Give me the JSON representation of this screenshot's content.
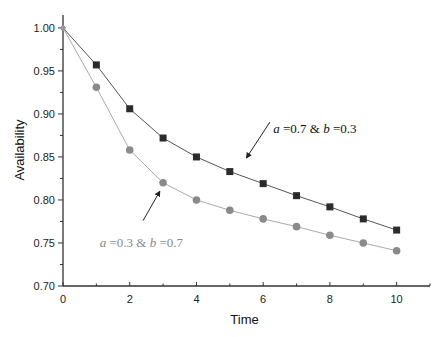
{
  "chart_data": {
    "type": "line",
    "title": "",
    "xlabel": "Time",
    "ylabel": "Availability",
    "xlim": [
      0,
      11
    ],
    "ylim": [
      0.7,
      1.015
    ],
    "x_ticks": [
      0,
      2,
      4,
      6,
      8,
      10
    ],
    "x_tick_labels": [
      "0",
      "2",
      "4",
      "6",
      "8",
      "10"
    ],
    "y_ticks": [
      0.7,
      0.75,
      0.8,
      0.85,
      0.9,
      0.95,
      1.0
    ],
    "y_tick_labels": [
      "0.70",
      "0.75",
      "0.80",
      "0.85",
      "0.90",
      "0.95",
      "1.00"
    ],
    "grid": false,
    "x": [
      0,
      1,
      2,
      3,
      4,
      5,
      6,
      7,
      8,
      9,
      10
    ],
    "series": [
      {
        "name": "a =0.7 & b =0.3",
        "marker": "square",
        "color": "#2b2b2b",
        "line_color": "#555555",
        "values": [
          1.0,
          0.957,
          0.906,
          0.872,
          0.85,
          0.833,
          0.819,
          0.805,
          0.792,
          0.778,
          0.765
        ]
      },
      {
        "name": "a =0.3 & b =0.7",
        "marker": "circle",
        "color": "#8a8a8a",
        "line_color": "#aaaaaa",
        "values": [
          1.0,
          0.931,
          0.858,
          0.82,
          0.8,
          0.788,
          0.778,
          0.769,
          0.759,
          0.75,
          0.741
        ]
      }
    ],
    "annotations": [
      {
        "parts": [
          {
            "t": "a",
            "i": true
          },
          {
            "t": " =0.7 & ",
            "i": false
          },
          {
            "t": "b",
            "i": true
          },
          {
            "t": " =0.3",
            "i": false
          }
        ],
        "color": "#111111",
        "text_at": [
          6.3,
          0.878
        ],
        "arrow_from": [
          6.2,
          0.8905
        ],
        "arrow_to": [
          5.5,
          0.849
        ]
      },
      {
        "parts": [
          {
            "t": "a",
            "i": true
          },
          {
            "t": " =0.3 & ",
            "i": false
          },
          {
            "t": "b",
            "i": true
          },
          {
            "t": " =0.7",
            "i": false
          }
        ],
        "color": "#8a8a8a",
        "text_at": [
          1.1,
          0.745
        ],
        "arrow_from": [
          2.4,
          0.776
        ],
        "arrow_to": [
          2.9,
          0.81
        ]
      }
    ],
    "legend": "none"
  }
}
